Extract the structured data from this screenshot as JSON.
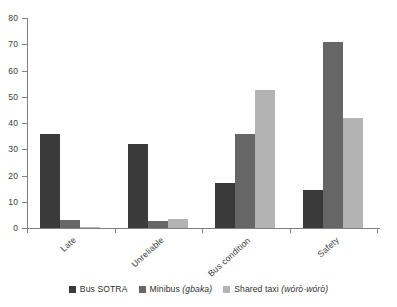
{
  "chart_data": {
    "type": "bar",
    "title": "",
    "subtitle": "",
    "xlabel": "",
    "ylabel": "",
    "ylim": [
      0,
      80
    ],
    "yticks": [
      0,
      10,
      20,
      30,
      40,
      50,
      60,
      70,
      80
    ],
    "ytick_labels": [
      "0",
      "10",
      "20",
      "30",
      "40",
      "50",
      "60",
      "70",
      "80"
    ],
    "grid": false,
    "legend_position": "bottom",
    "orientation": "vertical",
    "grouping": "grouped",
    "categories": [
      "Late",
      "Unreliable",
      "Bus condition",
      "Safety"
    ],
    "series": [
      {
        "name": "Bus SOTRA",
        "name_plain": "Bus SOTRA",
        "name_italic": "",
        "color": "#3a3a3a",
        "values": [
          36,
          32,
          17,
          14.5
        ]
      },
      {
        "name": "Minibus (gbaka)",
        "name_plain": "Minibus",
        "name_italic": "(gbaka)",
        "color": "#666666",
        "values": [
          3,
          2.5,
          36,
          71
        ]
      },
      {
        "name": "Shared taxi (wórò-wórò)",
        "name_plain": "Shared taxi",
        "name_italic": "(wórò-wórò)",
        "color": "#b3b3b3",
        "values": [
          0.5,
          3.5,
          52.5,
          42
        ]
      }
    ]
  },
  "axis": {
    "axis_color": "#808080"
  }
}
